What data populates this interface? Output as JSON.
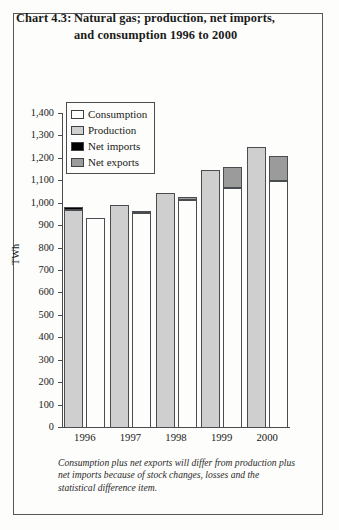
{
  "title": {
    "number": "Chart 4.3:",
    "text": "Natural gas; production, net imports, and consumption 1996 to 2000"
  },
  "legend": [
    {
      "label": "Consumption",
      "swatch": "consumption",
      "color": "#fdfdfb"
    },
    {
      "label": "Production",
      "swatch": "production",
      "color": "#cfcfcf"
    },
    {
      "label": "Net imports",
      "swatch": "netimports",
      "color": "#000000"
    },
    {
      "label": "Net exports",
      "swatch": "netexports",
      "color": "#9b9b9b"
    }
  ],
  "axis": {
    "y_title": "TWh",
    "y_ticks": [
      "1,400",
      "1,300",
      "1,200",
      "1,100",
      "1,000",
      "900",
      "800",
      "700",
      "600",
      "500",
      "400",
      "300",
      "200",
      "100",
      "0"
    ],
    "x_ticks": [
      "1996",
      "1997",
      "1998",
      "1999",
      "2000"
    ]
  },
  "footnote": "Consumption plus net exports will differ from production plus net imports because of stock changes, losses and the statistical difference item.",
  "chart_data": {
    "type": "bar",
    "xlabel": "",
    "ylabel": "TWh",
    "ylim": [
      0,
      1400
    ],
    "ytick_step": 100,
    "grid": false,
    "legend_position": "inside-top-left",
    "categories": [
      "1996",
      "1997",
      "1998",
      "1999",
      "2000"
    ],
    "bar_order_in_group": [
      "production_stack",
      "consumption_stack"
    ],
    "series": [
      {
        "name": "Production",
        "stack": "left",
        "values": [
          970,
          995,
          1050,
          1150,
          1255
        ]
      },
      {
        "name": "Net imports",
        "stack": "left",
        "values": [
          15,
          0,
          0,
          0,
          0
        ]
      },
      {
        "name": "Consumption",
        "stack": "right",
        "values": [
          935,
          960,
          1015,
          1070,
          1100
        ]
      },
      {
        "name": "Net exports",
        "stack": "right",
        "values": [
          0,
          5,
          15,
          95,
          115
        ]
      }
    ],
    "stack_tops": {
      "production_plus_net_imports": [
        985,
        995,
        1050,
        1150,
        1255
      ],
      "consumption_plus_net_exports": [
        935,
        965,
        1030,
        1165,
        1215
      ]
    }
  }
}
